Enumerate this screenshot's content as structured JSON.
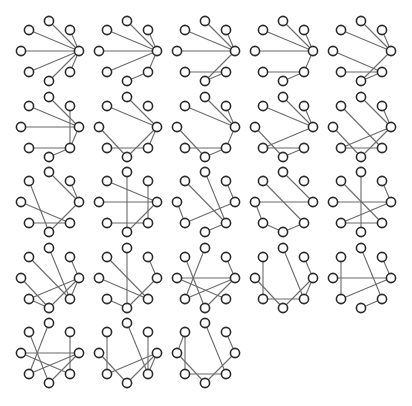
{
  "figure": {
    "title": "",
    "layout": {
      "cols": 5,
      "col_spacing": 78,
      "row_spacing": 75.5,
      "node_radius": 4.6
    },
    "colors": {
      "edge": "#6b6b6b",
      "node_stroke": "#2a2a2a",
      "node_fill": "#ffffff",
      "background": "#ffffff"
    },
    "node_positions": {
      "T": [
        49,
        21
      ],
      "UL": [
        29,
        30
      ],
      "UR": [
        70,
        30
      ],
      "L": [
        21,
        51
      ],
      "R": [
        79,
        51
      ],
      "LL": [
        29,
        72
      ],
      "B": [
        49,
        81
      ],
      "LR": [
        70,
        72
      ]
    },
    "graphs": [
      {
        "edges": [
          [
            "R",
            "T"
          ],
          [
            "R",
            "UL"
          ],
          [
            "R",
            "UR"
          ],
          [
            "R",
            "L"
          ],
          [
            "R",
            "LL"
          ],
          [
            "R",
            "B"
          ],
          [
            "R",
            "LR"
          ]
        ]
      },
      {
        "edges": [
          [
            "R",
            "T"
          ],
          [
            "R",
            "UL"
          ],
          [
            "R",
            "UR"
          ],
          [
            "R",
            "L"
          ],
          [
            "R",
            "LL"
          ],
          [
            "R",
            "LR"
          ],
          [
            "LR",
            "B"
          ]
        ]
      },
      {
        "edges": [
          [
            "R",
            "T"
          ],
          [
            "R",
            "UL"
          ],
          [
            "R",
            "UR"
          ],
          [
            "R",
            "L"
          ],
          [
            "R",
            "B"
          ],
          [
            "LL",
            "LR"
          ],
          [
            "B",
            "LR"
          ]
        ]
      },
      {
        "edges": [
          [
            "R",
            "T"
          ],
          [
            "R",
            "UL"
          ],
          [
            "R",
            "UR"
          ],
          [
            "R",
            "L"
          ],
          [
            "R",
            "LR"
          ],
          [
            "LL",
            "LR"
          ],
          [
            "B",
            "LR"
          ]
        ]
      },
      {
        "edges": [
          [
            "R",
            "T"
          ],
          [
            "R",
            "UL"
          ],
          [
            "R",
            "UR"
          ],
          [
            "L",
            "LR"
          ],
          [
            "R",
            "B"
          ],
          [
            "LL",
            "LR"
          ],
          [
            "B",
            "LR"
          ]
        ]
      },
      {
        "edges": [
          [
            "R",
            "T"
          ],
          [
            "R",
            "UL"
          ],
          [
            "R",
            "L"
          ],
          [
            "R",
            "LR"
          ],
          [
            "UR",
            "LR"
          ],
          [
            "LL",
            "LR"
          ],
          [
            "B",
            "LR"
          ]
        ]
      },
      {
        "edges": [
          [
            "R",
            "T"
          ],
          [
            "R",
            "UL"
          ],
          [
            "R",
            "LR"
          ],
          [
            "R",
            "B"
          ],
          [
            "L",
            "B"
          ],
          [
            "LL",
            "LR"
          ]
        ]
      },
      {
        "edges": [
          [
            "R",
            "T"
          ],
          [
            "R",
            "UL"
          ],
          [
            "R",
            "UR"
          ],
          [
            "L",
            "B"
          ],
          [
            "LL",
            "LR"
          ],
          [
            "B",
            "LR"
          ],
          [
            "R",
            "LR"
          ]
        ]
      },
      {
        "edges": [
          [
            "R",
            "T"
          ],
          [
            "R",
            "UL"
          ],
          [
            "R",
            "UR"
          ],
          [
            "R",
            "LL"
          ],
          [
            "L",
            "B"
          ],
          [
            "LL",
            "LR"
          ],
          [
            "B",
            "LR"
          ]
        ]
      },
      {
        "edges": [
          [
            "R",
            "T"
          ],
          [
            "UL",
            "LR"
          ],
          [
            "R",
            "LL"
          ],
          [
            "R",
            "B"
          ],
          [
            "L",
            "B"
          ],
          [
            "LL",
            "LR"
          ],
          [
            "UR",
            "R"
          ]
        ]
      },
      {
        "edges": [
          [
            "R",
            "T"
          ],
          [
            "UL",
            "B"
          ],
          [
            "L",
            "LR"
          ],
          [
            "LL",
            "LR"
          ],
          [
            "B",
            "R"
          ],
          [
            "UR",
            "R"
          ]
        ]
      },
      {
        "edges": [
          [
            "UL",
            "R"
          ],
          [
            "T",
            "B"
          ],
          [
            "L",
            "R"
          ],
          [
            "UR",
            "LR"
          ],
          [
            "LL",
            "LR"
          ],
          [
            "B",
            "R"
          ]
        ]
      },
      {
        "edges": [
          [
            "T",
            "LR"
          ],
          [
            "UL",
            "LR"
          ],
          [
            "UR",
            "R"
          ],
          [
            "L",
            "LL"
          ],
          [
            "LL",
            "R"
          ],
          [
            "B",
            "LR"
          ]
        ]
      },
      {
        "edges": [
          [
            "T",
            "R"
          ],
          [
            "UL",
            "LR"
          ],
          [
            "L",
            "R"
          ],
          [
            "L",
            "LL"
          ],
          [
            "LL",
            "B"
          ],
          [
            "B",
            "LR"
          ]
        ]
      },
      {
        "edges": [
          [
            "T",
            "B"
          ],
          [
            "UL",
            "LR"
          ],
          [
            "UR",
            "R"
          ],
          [
            "L",
            "R"
          ],
          [
            "LL",
            "R"
          ],
          [
            "LL",
            "LR"
          ]
        ]
      },
      {
        "edges": [
          [
            "T",
            "LR"
          ],
          [
            "UL",
            "LR"
          ],
          [
            "UR",
            "R"
          ],
          [
            "LL",
            "R"
          ],
          [
            "LL",
            "B"
          ],
          [
            "B",
            "R"
          ],
          [
            "R",
            "LR"
          ],
          [
            "L",
            "B"
          ]
        ]
      },
      {
        "edges": [
          [
            "T",
            "B"
          ],
          [
            "UL",
            "LR"
          ],
          [
            "UR",
            "R"
          ],
          [
            "L",
            "LR"
          ],
          [
            "LL",
            "B"
          ],
          [
            "B",
            "R"
          ]
        ]
      },
      {
        "edges": [
          [
            "T",
            "LL"
          ],
          [
            "UL",
            "B"
          ],
          [
            "L",
            "R"
          ],
          [
            "L",
            "LR"
          ],
          [
            "LL",
            "R"
          ],
          [
            "B",
            "R"
          ],
          [
            "UR",
            "R"
          ]
        ]
      },
      {
        "edges": [
          [
            "UL",
            "LL"
          ],
          [
            "T",
            "LR"
          ],
          [
            "UR",
            "R"
          ],
          [
            "L",
            "B"
          ],
          [
            "LL",
            "LR"
          ],
          [
            "B",
            "R"
          ],
          [
            "R",
            "LR"
          ]
        ]
      },
      {
        "edges": [
          [
            "UL",
            "LL"
          ],
          [
            "T",
            "LR"
          ],
          [
            "UR",
            "R"
          ],
          [
            "L",
            "R"
          ],
          [
            "LL",
            "R"
          ],
          [
            "B",
            "LR"
          ]
        ]
      },
      {
        "edges": [
          [
            "T",
            "LL"
          ],
          [
            "UL",
            "B"
          ],
          [
            "UR",
            "LR"
          ],
          [
            "L",
            "R"
          ],
          [
            "L",
            "LR"
          ],
          [
            "LL",
            "R"
          ],
          [
            "B",
            "R"
          ]
        ]
      },
      {
        "edges": [
          [
            "UL",
            "LL"
          ],
          [
            "T",
            "LR"
          ],
          [
            "UR",
            "LR"
          ],
          [
            "L",
            "B"
          ],
          [
            "LL",
            "R"
          ],
          [
            "B",
            "R"
          ],
          [
            "R",
            "LR"
          ]
        ]
      },
      {
        "edges": [
          [
            "UL",
            "L"
          ],
          [
            "UL",
            "LL"
          ],
          [
            "T",
            "LR"
          ],
          [
            "UR",
            "R"
          ],
          [
            "L",
            "B"
          ],
          [
            "LL",
            "LR"
          ],
          [
            "B",
            "R"
          ]
        ]
      }
    ]
  }
}
